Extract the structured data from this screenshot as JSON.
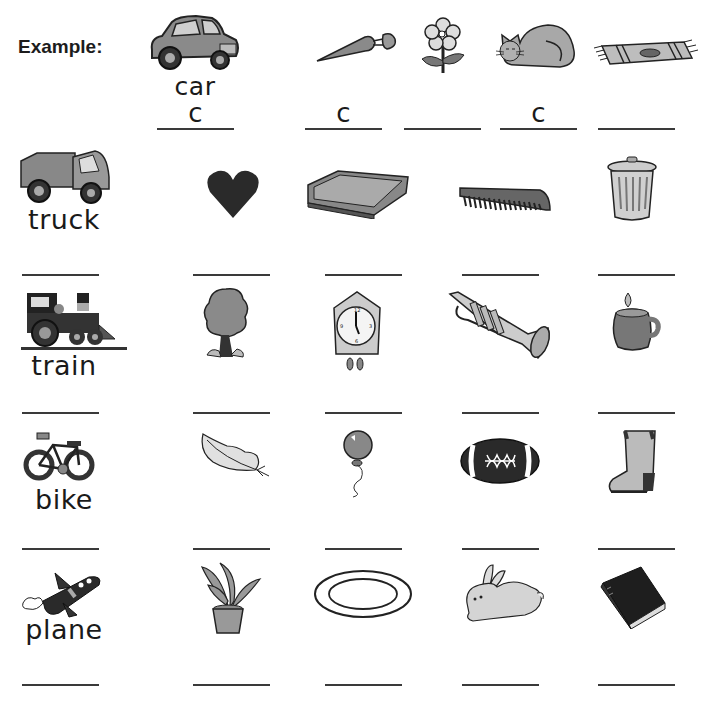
{
  "example": {
    "label": "Example:",
    "keyword": "car",
    "keyword_answer": "c",
    "items": [
      {
        "picture": "carrot",
        "answer": "c"
      },
      {
        "picture": "flower",
        "answer": ""
      },
      {
        "picture": "cat",
        "answer": "c"
      },
      {
        "picture": "rug",
        "answer": ""
      }
    ]
  },
  "rows": [
    {
      "keyword": "truck",
      "keyword_picture": "truck",
      "items": [
        "heart",
        "tray",
        "comb",
        "trash-can"
      ]
    },
    {
      "keyword": "train",
      "keyword_picture": "train",
      "items": [
        "tree",
        "cuckoo-clock",
        "trumpet",
        "mug"
      ]
    },
    {
      "keyword": "bike",
      "keyword_picture": "bike",
      "items": [
        "feather",
        "balloon",
        "football",
        "boot"
      ]
    },
    {
      "keyword": "plane",
      "keyword_picture": "plane",
      "items": [
        "plant",
        "plate",
        "rabbit",
        "book"
      ]
    }
  ]
}
